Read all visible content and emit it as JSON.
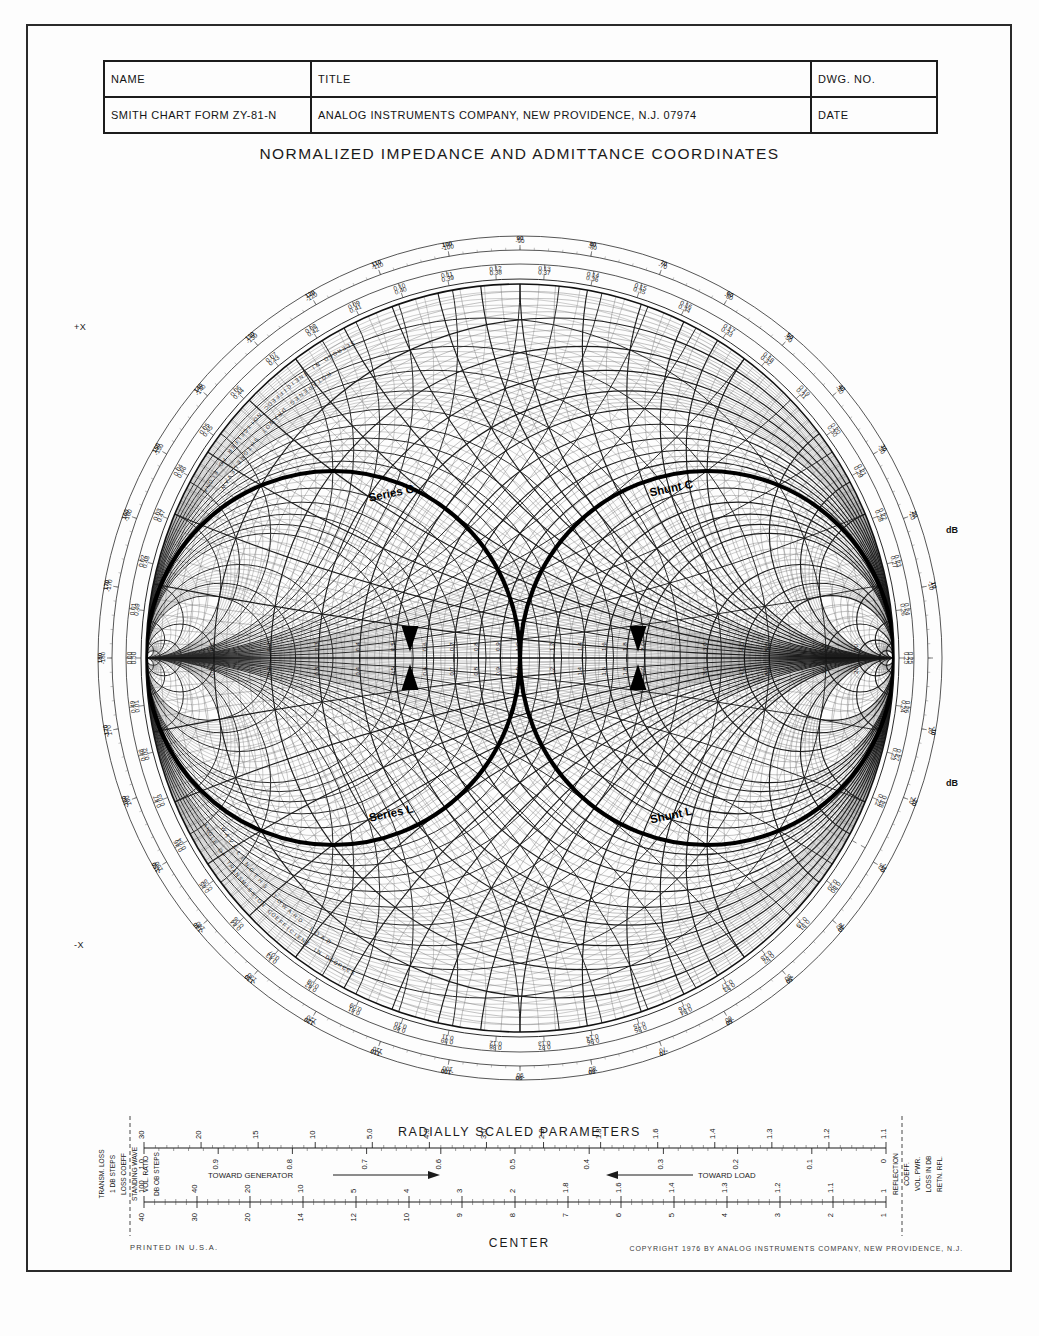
{
  "title_block": {
    "headers": {
      "name": "NAME",
      "title": "TITLE",
      "dwg_no": "DWG. NO."
    },
    "row2": {
      "form": "SMITH CHART  FORM ZY-81-N",
      "company": "ANALOG INSTRUMENTS COMPANY, NEW PROVIDENCE, N.J. 07974",
      "date": "DATE"
    }
  },
  "chart_title": "NORMALIZED IMPEDANCE AND ADMITTANCE COORDINATES",
  "footer": {
    "printed": "PRINTED IN U.S.A.",
    "copyright": "COPYRIGHT 1976 BY ANALOG INSTRUMENTS COMPANY, NEW PROVIDENCE, N.J.",
    "center": "CENTER"
  },
  "radial_params": {
    "title": "RADIALLY SCALED PARAMETERS",
    "toward_generator": "TOWARD GENERATOR",
    "toward_load": "TOWARD LOAD",
    "left_labels": [
      "TRANSM. LOSS",
      "1 DB STEPS",
      "LOSS COEFF",
      "STANDING WAVE",
      "VOL. RATIO",
      "DB OB STEPS"
    ],
    "right_labels": [
      "REFLECTION",
      "COEFF.",
      "VOL. PWR.",
      "LOSS IN DB",
      "RETN. RFL."
    ]
  },
  "annotations": [
    {
      "label": "Series C",
      "x": 392,
      "y": 497
    },
    {
      "label": "Shunt C",
      "x": 672,
      "y": 492
    },
    {
      "label": "Series L",
      "x": 392,
      "y": 817
    },
    {
      "label": "Shunt L",
      "x": 672,
      "y": 819
    }
  ],
  "axis_labels": {
    "plus_x": "+X",
    "minus_x": "-X",
    "db_minus": "dB",
    "db_plus": "dB"
  },
  "rim_text": [
    "ANGLE OF REFLECTION COEFFICIENT IN DEGREES",
    "WAVELENGTHS TOWARD GENERATOR",
    "WAVELENGTHS TOWARD LOAD",
    "ANGLE OF TRANSMISSION COEFFICIENT IN DEGREES"
  ],
  "chart_data": {
    "type": "smith",
    "title": "NORMALIZED IMPEDANCE AND ADMITTANCE COORDINATES",
    "form": "ZY-81-N",
    "resistance_circles": [
      0.1,
      0.2,
      0.3,
      0.4,
      0.5,
      0.6,
      0.7,
      0.8,
      0.9,
      1.0,
      1.2,
      1.4,
      1.6,
      1.8,
      2.0,
      3.0,
      4.0,
      5.0,
      10.0,
      20.0,
      50.0
    ],
    "reactance_arcs": [
      0.1,
      0.2,
      0.3,
      0.4,
      0.5,
      0.6,
      0.7,
      0.8,
      0.9,
      1.0,
      1.2,
      1.4,
      1.6,
      1.8,
      2.0,
      3.0,
      4.0,
      5.0,
      10.0,
      20.0,
      50.0
    ],
    "real_axis_ticks": [
      "0.1",
      "0.2",
      "0.3",
      "0.4",
      "0.5",
      "0.6",
      "0.7",
      "0.8",
      "0.9",
      "1.0",
      "1.2",
      "1.4",
      "1.6",
      "1.8",
      "2.0",
      "3.0",
      "4.0",
      "5.0",
      "10",
      "20",
      "50"
    ],
    "wavelength_outer": [
      "0.00",
      "0.01",
      "0.02",
      "0.03",
      "0.04",
      "0.05",
      "0.06",
      "0.07",
      "0.08",
      "0.09",
      "0.10",
      "0.11",
      "0.12",
      "0.13",
      "0.14",
      "0.15",
      "0.16",
      "0.17",
      "0.18",
      "0.19",
      "0.20",
      "0.21",
      "0.22",
      "0.23",
      "0.24",
      "0.25",
      "0.26",
      "0.27",
      "0.28",
      "0.29",
      "0.30",
      "0.31",
      "0.32",
      "0.33",
      "0.34",
      "0.35",
      "0.36",
      "0.37",
      "0.38",
      "0.39",
      "0.40",
      "0.41",
      "0.42",
      "0.43",
      "0.44",
      "0.45",
      "0.46",
      "0.47",
      "0.48",
      "0.49"
    ],
    "angle_ticks_deg": [
      0,
      10,
      20,
      30,
      40,
      50,
      60,
      70,
      80,
      90,
      100,
      110,
      120,
      130,
      140,
      150,
      160,
      170,
      180,
      -170,
      -160,
      -150,
      -140,
      -130,
      -120,
      -110,
      -100,
      -90,
      -80,
      -70,
      -60,
      -50,
      -40,
      -30,
      -20,
      -10
    ],
    "highlight_curves": [
      {
        "name": "Series C",
        "kind": "constant-resistance-arc",
        "value": 1.0,
        "half": "upper"
      },
      {
        "name": "Shunt C",
        "kind": "constant-conductance-arc",
        "value": 1.0,
        "half": "upper"
      },
      {
        "name": "Series L",
        "kind": "constant-resistance-arc",
        "value": 1.0,
        "half": "lower"
      },
      {
        "name": "Shunt L",
        "kind": "constant-conductance-arc",
        "value": 1.0,
        "half": "lower"
      }
    ],
    "scales": {
      "transm_loss_coeff": {
        "min": 1.0,
        "ticks": [
          "1.1",
          "1.2",
          "1.3",
          "1.4",
          "1.6",
          "1.8",
          "2.0",
          "3.0",
          "4.0",
          "5.0",
          "10",
          "15",
          "20",
          "30"
        ]
      },
      "swr": {
        "ticks": [
          "1",
          "1.1",
          "1.2",
          "1.3",
          "1.4",
          "1.6",
          "1.8",
          "2",
          "3",
          "4",
          "5",
          "10",
          "20",
          "40",
          "100"
        ]
      },
      "swr_db": {
        "ticks": [
          "1",
          "2",
          "3",
          "4",
          "5",
          "6",
          "7",
          "8",
          "9",
          "10",
          "12",
          "14",
          "20",
          "30",
          "40"
        ]
      },
      "refl_coeff_vol": {
        "ticks": [
          "0",
          "0.1",
          "0.2",
          "0.3",
          "0.4",
          "0.5",
          "0.6",
          "0.7",
          "0.8",
          "0.9",
          "1.0"
        ]
      },
      "refl_coeff_pwr": {
        "ticks": [
          "0",
          "0.1",
          "0.2",
          "0.3",
          "0.4",
          "0.5",
          "0.6",
          "0.7",
          "0.8",
          "0.9",
          "1.0"
        ]
      },
      "return_loss_db": {
        "ticks": [
          "0",
          "1",
          "2",
          "3",
          "4",
          "5",
          "6",
          "7",
          "8",
          "9",
          "10",
          "12",
          "14",
          "20",
          "30"
        ]
      },
      "atten_db": {
        "ticks": [
          "0",
          "0.2",
          "0.4",
          "0.6",
          "0.8",
          "1.0",
          "1.5",
          "2",
          "3",
          "4",
          "5",
          "6",
          "10",
          "15"
        ]
      }
    }
  }
}
